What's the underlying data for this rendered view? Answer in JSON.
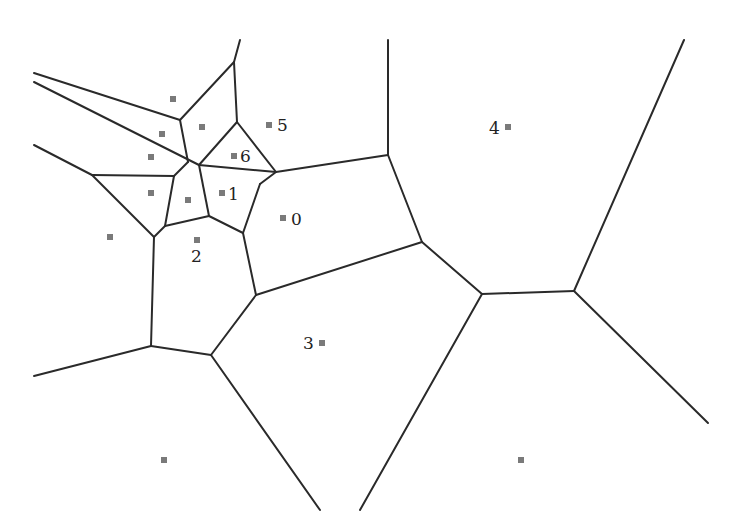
{
  "diagram": {
    "type": "voronoi",
    "width": 731,
    "height": 531,
    "colors": {
      "edge": "#2a2a2a",
      "site": "#7a7a7a",
      "label": "#222222",
      "background": "#ffffff"
    },
    "edges": [
      [
        240,
        40,
        234,
        62
      ],
      [
        234,
        62,
        180,
        120
      ],
      [
        234,
        62,
        237,
        122
      ],
      [
        34,
        73,
        180,
        120
      ],
      [
        180,
        120,
        188,
        162
      ],
      [
        34,
        82,
        199,
        165
      ],
      [
        199,
        165,
        276,
        172
      ],
      [
        237,
        122,
        199,
        165
      ],
      [
        237,
        122,
        276,
        172
      ],
      [
        34,
        145,
        92,
        175
      ],
      [
        92,
        175,
        174,
        176
      ],
      [
        174,
        176,
        188,
        162
      ],
      [
        174,
        176,
        165,
        226
      ],
      [
        199,
        165,
        209,
        216
      ],
      [
        92,
        175,
        154,
        237
      ],
      [
        154,
        237,
        165,
        226
      ],
      [
        165,
        226,
        209,
        216
      ],
      [
        209,
        216,
        243,
        233
      ],
      [
        276,
        172,
        260,
        184
      ],
      [
        260,
        184,
        243,
        233
      ],
      [
        276,
        172,
        388,
        155
      ],
      [
        388,
        40,
        388,
        155
      ],
      [
        388,
        155,
        422,
        242
      ],
      [
        243,
        233,
        256,
        295
      ],
      [
        256,
        295,
        422,
        242
      ],
      [
        422,
        242,
        482,
        294
      ],
      [
        482,
        294,
        574,
        291
      ],
      [
        574,
        291,
        684,
        40
      ],
      [
        574,
        291,
        708,
        423
      ],
      [
        482,
        294,
        360,
        510
      ],
      [
        154,
        237,
        151,
        346
      ],
      [
        151,
        346,
        34,
        376
      ],
      [
        151,
        346,
        211,
        355
      ],
      [
        211,
        355,
        256,
        295
      ],
      [
        211,
        355,
        320,
        510
      ]
    ],
    "sites": [
      {
        "x": 173,
        "y": 99,
        "label": ""
      },
      {
        "x": 202,
        "y": 127,
        "label": ""
      },
      {
        "x": 162,
        "y": 134,
        "label": ""
      },
      {
        "x": 151,
        "y": 157,
        "label": ""
      },
      {
        "x": 151,
        "y": 193,
        "label": ""
      },
      {
        "x": 188,
        "y": 200,
        "label": ""
      },
      {
        "x": 110,
        "y": 237,
        "label": ""
      },
      {
        "x": 197,
        "y": 240,
        "label": "2",
        "lx": 191,
        "ly": 262
      },
      {
        "x": 234,
        "y": 156,
        "label": "6",
        "lx": 240,
        "ly": 162
      },
      {
        "x": 222,
        "y": 193,
        "label": "1",
        "lx": 228,
        "ly": 200
      },
      {
        "x": 269,
        "y": 125,
        "label": "5",
        "lx": 277,
        "ly": 131
      },
      {
        "x": 283,
        "y": 218,
        "label": "0",
        "lx": 291,
        "ly": 225
      },
      {
        "x": 322,
        "y": 343,
        "label": "3",
        "lx": 303,
        "ly": 349
      },
      {
        "x": 508,
        "y": 127,
        "label": "4",
        "lx": 489,
        "ly": 134
      },
      {
        "x": 164,
        "y": 460,
        "label": ""
      },
      {
        "x": 521,
        "y": 460,
        "label": ""
      }
    ]
  }
}
